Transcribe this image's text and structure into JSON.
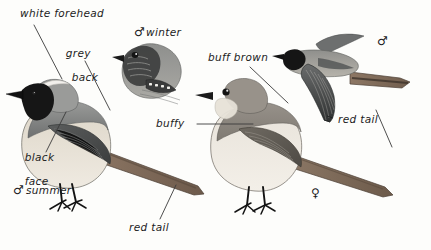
{
  "plate": {
    "title": "Black Redstart plumage plate",
    "background": "#fdfdfb",
    "width": 431,
    "height": 250
  },
  "labels": [
    {
      "id": "white-forehead",
      "text": "white forehead",
      "x": 20,
      "y": 8,
      "lines": [
        "white forehead"
      ]
    },
    {
      "id": "grey-back",
      "text": "grey back",
      "x": 51,
      "y": 36,
      "lines": [
        "grey",
        "back"
      ]
    },
    {
      "id": "male-winter",
      "text": "winter",
      "x": 146,
      "y": 27,
      "lines": [
        "winter"
      ]
    },
    {
      "id": "buff-brown",
      "text": "buff brown",
      "x": 208,
      "y": 52,
      "lines": [
        "buff brown"
      ]
    },
    {
      "id": "buffy",
      "text": "buffy",
      "x": 156,
      "y": 118,
      "lines": [
        "buffy"
      ]
    },
    {
      "id": "black-face",
      "text": "black face",
      "x": 10,
      "y": 140,
      "lines": [
        "black",
        "face"
      ]
    },
    {
      "id": "male-summer",
      "text": "summer",
      "x": 26,
      "y": 184,
      "lines": [
        "summer"
      ]
    },
    {
      "id": "red-tail-left",
      "text": "red tail",
      "x": 129,
      "y": 222,
      "lines": [
        "red tail"
      ]
    },
    {
      "id": "red-tail-right",
      "text": "red tail",
      "x": 338,
      "y": 114,
      "lines": [
        "red tail"
      ]
    }
  ],
  "symbols": [
    {
      "id": "male-winter-symbol",
      "glyph": "♂",
      "x": 134,
      "y": 26
    },
    {
      "id": "male-summer-symbol",
      "glyph": "♂",
      "x": 13,
      "y": 183
    },
    {
      "id": "male-flight-symbol",
      "glyph": "♂",
      "x": 377,
      "y": 35
    },
    {
      "id": "female-symbol",
      "glyph": "♀",
      "x": 311,
      "y": 187
    }
  ],
  "birds": [
    {
      "id": "male-summer-perched",
      "caption": "male summer",
      "x": 6,
      "y": 78
    },
    {
      "id": "male-winter-head",
      "caption": "male winter head",
      "x": 112,
      "y": 40
    },
    {
      "id": "male-flight",
      "caption": "male in flight",
      "x": 272,
      "y": 28
    },
    {
      "id": "female-perched",
      "caption": "female",
      "x": 193,
      "y": 75
    }
  ],
  "colors": {
    "ink": "#1c1c1c",
    "leader": "#3a3a3a",
    "black_plumage": "#1a1a1a",
    "grey_back": "#7d7f80",
    "dark_wing": "#4a4c4d",
    "buff_underpart": "#cfc6b6",
    "pale_belly": "#ece7dd",
    "red_tail": "#8e7a67",
    "brown_upper": "#8b8276",
    "leg": "#1e1e1e",
    "white": "#f4f2ee"
  }
}
